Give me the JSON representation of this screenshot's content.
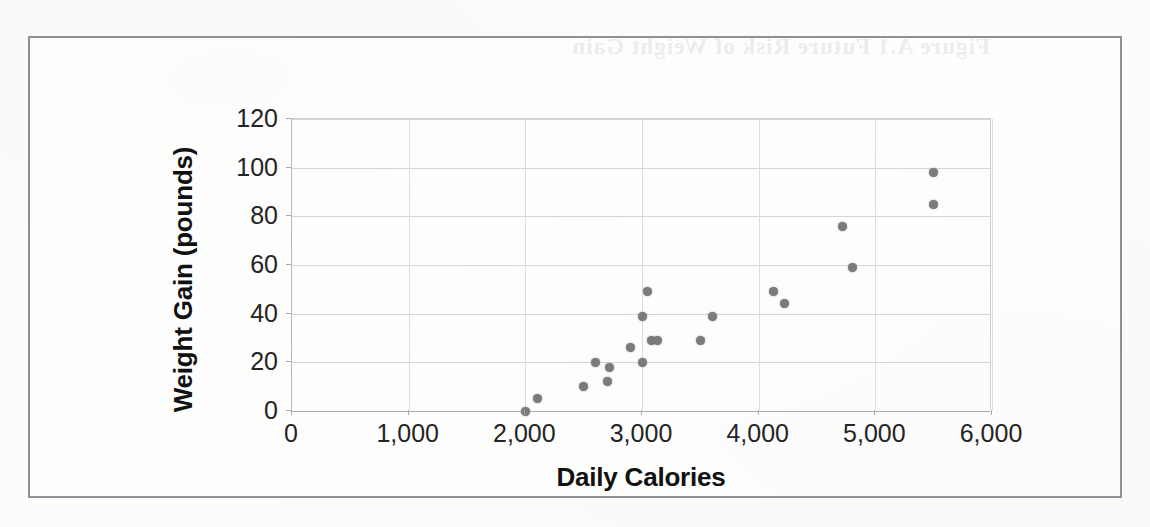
{
  "figure": {
    "background_color": "#fcfcfb",
    "frame_color": "#8e9095",
    "marker_color": "#7b7b7d",
    "gridline_color": "#d5d5d6",
    "axis_color": "#a9a9ab",
    "bleed_through_text": "Figure A.1  Future Risk of Weight Gain"
  },
  "chart_data": {
    "type": "scatter",
    "title": "",
    "xlabel": "Daily Calories",
    "ylabel": "Weight Gain (pounds)",
    "xlim": [
      0,
      6000
    ],
    "ylim": [
      0,
      120
    ],
    "xticks": [
      0,
      1000,
      2000,
      3000,
      4000,
      5000,
      6000
    ],
    "xticklabels": [
      "0",
      "1,000",
      "2,000",
      "3,000",
      "4,000",
      "5,000",
      "6,000"
    ],
    "yticks": [
      0,
      20,
      40,
      60,
      80,
      100,
      120
    ],
    "yticklabels": [
      "0",
      "20",
      "40",
      "60",
      "80",
      "100",
      "120"
    ],
    "grid": "both",
    "legend": "none",
    "marker": "circle",
    "series": [
      {
        "name": "Weight Gain vs Daily Calories",
        "points": [
          {
            "x": 2000,
            "y": 0
          },
          {
            "x": 2100,
            "y": 5
          },
          {
            "x": 2500,
            "y": 10
          },
          {
            "x": 2600,
            "y": 20
          },
          {
            "x": 2700,
            "y": 12
          },
          {
            "x": 2720,
            "y": 18
          },
          {
            "x": 2900,
            "y": 26
          },
          {
            "x": 3000,
            "y": 39
          },
          {
            "x": 3000,
            "y": 20
          },
          {
            "x": 3050,
            "y": 49
          },
          {
            "x": 3080,
            "y": 29
          },
          {
            "x": 3130,
            "y": 29
          },
          {
            "x": 3500,
            "y": 29
          },
          {
            "x": 3600,
            "y": 39
          },
          {
            "x": 4130,
            "y": 49
          },
          {
            "x": 4220,
            "y": 44
          },
          {
            "x": 4720,
            "y": 76
          },
          {
            "x": 4800,
            "y": 59
          },
          {
            "x": 5500,
            "y": 98
          },
          {
            "x": 5500,
            "y": 85
          }
        ]
      }
    ]
  }
}
